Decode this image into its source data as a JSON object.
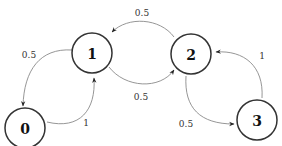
{
  "diagram": {
    "type": "state-transition",
    "nodes": [
      {
        "id": "0",
        "label": "0",
        "cx": 25,
        "cy": 128
      },
      {
        "id": "1",
        "label": "1",
        "cx": 92,
        "cy": 53
      },
      {
        "id": "2",
        "label": "2",
        "cx": 191,
        "cy": 54
      },
      {
        "id": "3",
        "label": "3",
        "cx": 257,
        "cy": 120
      }
    ],
    "edges": [
      {
        "from": "1",
        "to": "0",
        "label": "0.5"
      },
      {
        "from": "0",
        "to": "1",
        "label": "1"
      },
      {
        "from": "1",
        "to": "2",
        "label": "0.5"
      },
      {
        "from": "2",
        "to": "1",
        "label": "0.5"
      },
      {
        "from": "2",
        "to": "3",
        "label": "0.5"
      },
      {
        "from": "3",
        "to": "2",
        "label": "1"
      }
    ],
    "colors": {
      "node_stroke": "#333333",
      "edge_stroke": "#8a8a8a",
      "background": "#ffffff"
    }
  }
}
